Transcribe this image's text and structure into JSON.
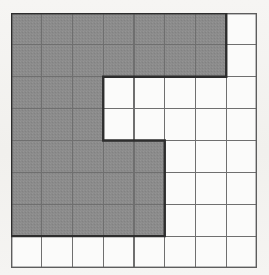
{
  "figure": {
    "description": "A grid of unit squares with a contiguous shaded region outlined by a heavy border.",
    "grid": {
      "columns": 8,
      "rows": 8,
      "cell_width_px": 30.75,
      "cell_height_px": 31.875,
      "origin_x_px": 11,
      "origin_y_px": 13,
      "width_px": 246,
      "height_px": 255
    },
    "colors": {
      "paper": "#f4f3f1",
      "shade_fill": "#8b8b8b",
      "grid_line": "#6f6f6f",
      "outline": "#2d2d2d",
      "cell_white": "#fbfbfa"
    },
    "line_widths": {
      "grid_line_px": 1.1,
      "outline_px": 2.4,
      "border_px": 1.4
    },
    "shaded_cells": [
      [
        1,
        1
      ],
      [
        1,
        2
      ],
      [
        1,
        3
      ],
      [
        1,
        4
      ],
      [
        1,
        5
      ],
      [
        1,
        6
      ],
      [
        1,
        7
      ],
      [
        2,
        1
      ],
      [
        2,
        2
      ],
      [
        2,
        3
      ],
      [
        2,
        4
      ],
      [
        2,
        5
      ],
      [
        2,
        6
      ],
      [
        2,
        7
      ],
      [
        3,
        1
      ],
      [
        3,
        2
      ],
      [
        3,
        3
      ],
      [
        4,
        1
      ],
      [
        4,
        2
      ],
      [
        4,
        3
      ],
      [
        5,
        1
      ],
      [
        5,
        2
      ],
      [
        5,
        3
      ],
      [
        5,
        4
      ],
      [
        5,
        5
      ],
      [
        6,
        1
      ],
      [
        6,
        2
      ],
      [
        6,
        3
      ],
      [
        6,
        4
      ],
      [
        6,
        5
      ],
      [
        7,
        1
      ],
      [
        7,
        2
      ],
      [
        7,
        3
      ],
      [
        7,
        4
      ],
      [
        7,
        5
      ]
    ],
    "shaded_cell_count": 45,
    "row_shaded_spans": [
      {
        "row": 1,
        "from_col": 1,
        "to_col": 7
      },
      {
        "row": 2,
        "from_col": 1,
        "to_col": 7
      },
      {
        "row": 3,
        "from_col": 1,
        "to_col": 3
      },
      {
        "row": 4,
        "from_col": 1,
        "to_col": 3
      },
      {
        "row": 5,
        "from_col": 1,
        "to_col": 5
      },
      {
        "row": 6,
        "from_col": 1,
        "to_col": 5
      },
      {
        "row": 7,
        "from_col": 1,
        "to_col": 5
      },
      {
        "row": 8,
        "from_col": 0,
        "to_col": 0
      }
    ],
    "outline_path_cells": "Start (0,0) right to (7,0), down to (7,2), left to (3,2), down to (3,4), right to (5,4), down to (5,7), left to (0,7), close.",
    "notch": {
      "description": "Rectangular white notch cut into the shaded region",
      "columns": [
        4,
        5
      ],
      "rows": [
        3,
        4
      ],
      "cells": 4
    }
  }
}
